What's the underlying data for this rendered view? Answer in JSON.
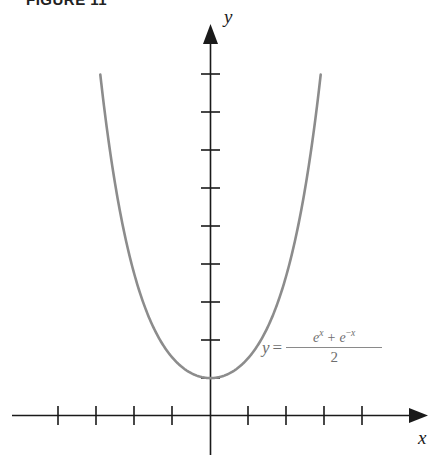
{
  "figure": {
    "label": "FIGURE 11",
    "background_color": "#ffffff",
    "axis_color": "#1a1a1a",
    "curve_color": "#8c8c8c",
    "equation_color": "#6e6e6e"
  },
  "axes": {
    "y_label": "y",
    "x_label": "x",
    "y_axis_name": "vertical-axis",
    "x_axis_name": "horizontal-axis",
    "y_arrow_name": "y-axis-arrow-icon",
    "x_arrow_name": "x-axis-arrow-icon"
  },
  "equation": {
    "lhs": "y",
    "equals": "=",
    "numerator_first_base": "e",
    "numerator_first_exponent": "x",
    "numerator_operator": "+",
    "numerator_second_base": "e",
    "numerator_second_exponent_sign": "−",
    "numerator_second_exponent": "x",
    "denominator": "2",
    "plain_text": "y = (e^x + e^-x) / 2"
  },
  "chart_data": {
    "type": "line",
    "title": "FIGURE 11",
    "xlabel": "x",
    "ylabel": "y",
    "function": "y = (e^x + e^(-x))/2",
    "function_name": "hyperbolic cosine",
    "xlim": [
      -4.2,
      5.2
    ],
    "ylim": [
      -1.2,
      10.2
    ],
    "grid": false,
    "legend": false,
    "x_ticks": [
      -4,
      -3,
      -2,
      -1,
      1,
      2,
      3,
      4
    ],
    "y_ticks": [
      1,
      2,
      3,
      4,
      5,
      6,
      7,
      8,
      9
    ],
    "x_tick_labels": [
      "",
      "",
      "",
      "",
      "",
      "",
      "",
      ""
    ],
    "y_tick_labels": [
      "",
      "",
      "",
      "",
      "",
      "",
      "",
      "",
      ""
    ],
    "annotations": [
      {
        "text": "y = (e^x + e^-x)/2",
        "x": 1.4,
        "y": 1.9
      }
    ],
    "series": [
      {
        "name": "y = cosh(x)",
        "color": "#8c8c8c",
        "x": [
          -2.9,
          -2.7,
          -2.5,
          -2.3,
          -2.1,
          -1.9,
          -1.7,
          -1.5,
          -1.3,
          -1.1,
          -0.9,
          -0.7,
          -0.5,
          -0.3,
          -0.1,
          0.1,
          0.3,
          0.5,
          0.7,
          0.9,
          1.1,
          1.3,
          1.5,
          1.7,
          1.9,
          2.1,
          2.3,
          2.5,
          2.7,
          2.9
        ],
        "y": [
          9.12,
          7.47,
          6.13,
          5.04,
          4.14,
          3.42,
          2.83,
          2.35,
          1.97,
          1.67,
          1.43,
          1.25,
          1.13,
          1.05,
          1.01,
          1.01,
          1.05,
          1.13,
          1.25,
          1.43,
          1.67,
          1.97,
          2.35,
          2.83,
          3.42,
          4.14,
          5.04,
          6.13,
          7.47,
          9.12
        ]
      }
    ]
  }
}
